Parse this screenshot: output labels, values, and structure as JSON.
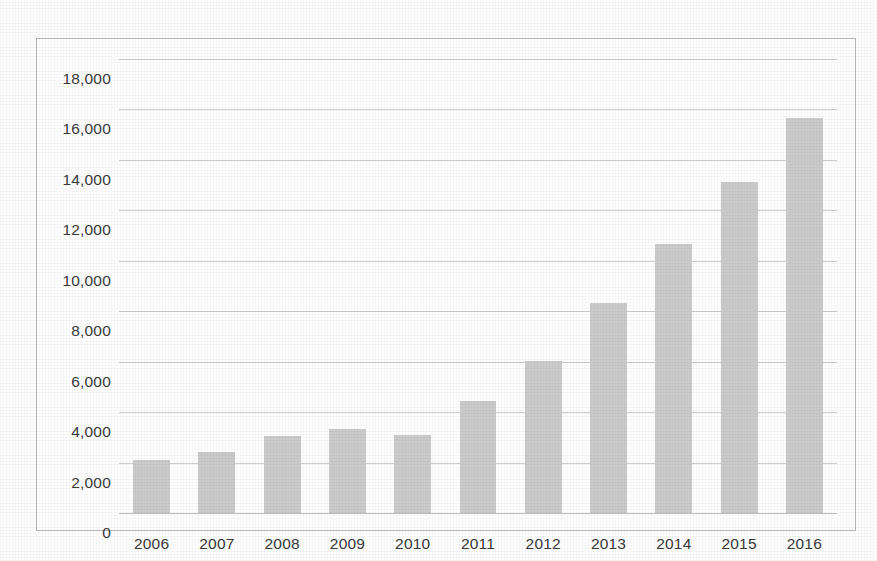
{
  "chart_data": {
    "type": "bar",
    "title": "",
    "subtitle": "",
    "xlabel": "",
    "ylabel": "",
    "categories": [
      "2006",
      "2007",
      "2008",
      "2009",
      "2010",
      "2011",
      "2012",
      "2013",
      "2014",
      "2015",
      "2016"
    ],
    "values": [
      2100,
      2420,
      3040,
      3330,
      3080,
      4460,
      6020,
      8340,
      10670,
      13120,
      15670
    ],
    "series": [
      {
        "name": "",
        "values": [
          2100,
          2420,
          3040,
          3330,
          3080,
          4460,
          6020,
          8340,
          10670,
          13120,
          15670
        ]
      }
    ],
    "ylim": [
      0,
      18000
    ],
    "ytick_values": [
      0,
      2000,
      4000,
      6000,
      8000,
      10000,
      12000,
      14000,
      16000,
      18000
    ],
    "ytick_labels": [
      "0",
      "2,000",
      "4,000",
      "6,000",
      "8,000",
      "10,000",
      "12,000",
      "14,000",
      "16,000",
      "18,000"
    ],
    "grid": true,
    "grid_axis": "y",
    "legend": false,
    "legend_position": "none",
    "bar_color": "#cbcbcb",
    "gridline_color": "#c4c4c4",
    "text_color": "#3a3a3a",
    "frame_color": "#b9b9b9",
    "background_color": "#fefefe"
  }
}
